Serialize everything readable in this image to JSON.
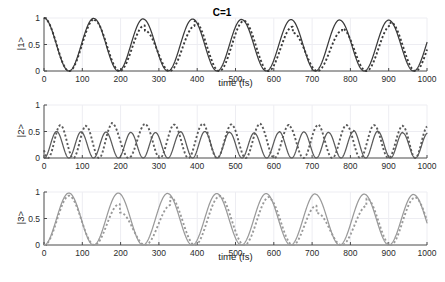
{
  "figure": {
    "title": "C=1",
    "xlabel": "time (fs)",
    "width": 445,
    "height": 282
  },
  "axes": {
    "xticks": [
      "0",
      "100",
      "200",
      "300",
      "400",
      "500",
      "600",
      "700",
      "800",
      "900",
      "1000"
    ],
    "yticks": [
      "0",
      "0.5",
      "1"
    ],
    "ylabel_1": "|1>",
    "ylabel_2": "|2>",
    "ylabel_3": "|3>"
  },
  "colors": {
    "curve_dark": "#3a3a3a",
    "curve_mid": "#5a5a5a",
    "curve_gray": "#9a9a9a",
    "axis": "#4a4a4a",
    "grid": "#ededf2",
    "background": "#ffffff"
  },
  "chart_data": [
    {
      "type": "line",
      "panel": 1,
      "title": "C=1",
      "xlabel": "time (fs)",
      "ylabel": "|1>",
      "xlim": [
        0,
        1000
      ],
      "ylim": [
        0,
        1
      ],
      "xticks": [
        0,
        100,
        200,
        300,
        400,
        500,
        600,
        700,
        800,
        900,
        1000
      ],
      "yticks": [
        0,
        0.5,
        1
      ],
      "grid": true,
      "legend": "none",
      "series": [
        {
          "name": "solid",
          "style": "solid",
          "color": "#3a3a3a",
          "description": "cos^2 population of state |1>, period 130 fs, full amplitude 0..1, maximum at t=0",
          "period": 130,
          "amplitude": 1.0,
          "phase": 0,
          "peaks_t": [
            0,
            130,
            259,
            388,
            516,
            645,
            772,
            900
          ],
          "peaks_y": [
            1.0,
            0.99,
            0.98,
            0.98,
            0.97,
            0.97,
            0.96,
            0.96
          ],
          "minima_t": [
            65,
            194,
            323,
            451,
            580,
            708,
            836,
            965
          ],
          "minima_y": [
            0,
            0,
            0,
            0,
            0,
            0,
            0,
            0
          ]
        },
        {
          "name": "dotted",
          "style": "dotted",
          "color": "#3a3a3a",
          "description": "second calculation, same period but slight lag that grows with time and reduced peak near t=250, 640, 770",
          "period": 130,
          "amplitude": 1.0,
          "peaks_t": [
            0,
            132,
            263,
            393,
            522,
            650,
            778,
            905
          ],
          "peaks_y": [
            1.0,
            0.96,
            0.76,
            0.94,
            0.95,
            0.72,
            0.8,
            0.92
          ],
          "minima_t": [
            68,
            198,
            328,
            456,
            585,
            713,
            841,
            968
          ],
          "minima_y": [
            0,
            0,
            0,
            0,
            0,
            0,
            0,
            0
          ]
        }
      ]
    },
    {
      "type": "line",
      "panel": 2,
      "xlabel": "time (fs)",
      "ylabel": "|2>",
      "xlim": [
        0,
        1000
      ],
      "ylim": [
        0,
        1
      ],
      "xticks": [
        0,
        100,
        200,
        300,
        400,
        500,
        600,
        700,
        800,
        900,
        1000
      ],
      "yticks": [
        0,
        0.5,
        1
      ],
      "grid": true,
      "legend": "none",
      "series": [
        {
          "name": "solid",
          "style": "solid",
          "color": "#5a5a5a",
          "description": "sin^2 type population of state |2>, double frequency, period 65 fs, starts at 0, peaks ~0.50",
          "period": 65,
          "amplitude": 0.5,
          "phase": 0,
          "peaks_t": [
            33,
            97,
            162,
            227,
            291,
            356,
            420,
            485,
            549,
            614,
            679,
            743,
            808,
            872,
            937
          ],
          "peaks_y": [
            0.5,
            0.49,
            0.49,
            0.48,
            0.48,
            0.5,
            0.5,
            0.48,
            0.47,
            0.5,
            0.49,
            0.48,
            0.52,
            0.5,
            0.47
          ]
        },
        {
          "name": "dotted",
          "style": "dotted",
          "color": "#5a5a5a",
          "description": "second calculation, higher amplitude ~0.65, phase lag that grows across the window",
          "period": 65,
          "amplitude": 0.65,
          "peaks_t": [
            43,
            110,
            177,
            265,
            340,
            414,
            490,
            563,
            640,
            715,
            790,
            862,
            937
          ],
          "peaks_y": [
            0.62,
            0.6,
            0.66,
            0.63,
            0.63,
            0.65,
            0.62,
            0.65,
            0.6,
            0.63,
            0.62,
            0.62,
            0.6
          ]
        }
      ]
    },
    {
      "type": "line",
      "panel": 3,
      "xlabel": "time (fs)",
      "ylabel": "|3>",
      "xlim": [
        0,
        1000
      ],
      "ylim": [
        0,
        1
      ],
      "xticks": [
        0,
        100,
        200,
        300,
        400,
        500,
        600,
        700,
        800,
        900,
        1000
      ],
      "yticks": [
        0,
        0.5,
        1
      ],
      "grid": true,
      "legend": "none",
      "series": [
        {
          "name": "solid",
          "style": "solid",
          "color": "#9a9a9a",
          "description": "sin^2 population of state |3>, period 130 fs, starts at 0, peaks ~1.0, complement of |1>",
          "period": 130,
          "amplitude": 1.0,
          "phase": 65,
          "peaks_t": [
            65,
            194,
            323,
            451,
            580,
            708,
            836,
            965
          ],
          "peaks_y": [
            0.98,
            0.98,
            0.97,
            0.97,
            0.97,
            0.96,
            0.96,
            0.95
          ],
          "minima_t": [
            0,
            130,
            259,
            388,
            516,
            645,
            772,
            900
          ],
          "minima_y": [
            0,
            0,
            0,
            0,
            0,
            0,
            0,
            0
          ]
        },
        {
          "name": "dotted",
          "style": "dotted",
          "color": "#9a9a9a",
          "description": "second calculation, same period with growing lag and reduced peaks near t=195 and t=705",
          "period": 130,
          "amplitude": 1.0,
          "peaks_t": [
            66,
            198,
            330,
            458,
            588,
            712,
            842,
            968
          ],
          "peaks_y": [
            0.93,
            0.61,
            0.9,
            0.93,
            0.88,
            0.6,
            0.88,
            0.9
          ],
          "minima_t": [
            0,
            133,
            265,
            393,
            522,
            650,
            780,
            905
          ],
          "minima_y": [
            0,
            0,
            0,
            0,
            0,
            0,
            0,
            0
          ]
        }
      ]
    }
  ]
}
